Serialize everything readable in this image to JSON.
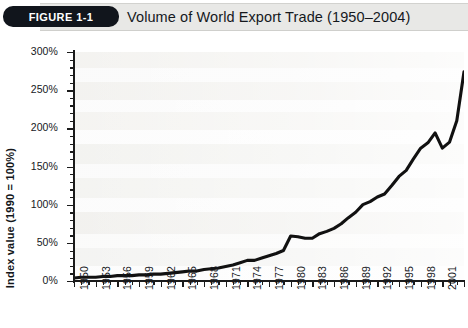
{
  "header": {
    "figure_badge": "FIGURE 1-1",
    "title": "Volume of World Export Trade (1950–2004)"
  },
  "footer": {
    "source_cropped": ""
  },
  "axes": {
    "y_title": "Index value (1990 = 100%)",
    "y_ticks": [
      "0%",
      "50%",
      "100%",
      "150%",
      "200%",
      "250%",
      "300%"
    ],
    "x_ticks": [
      "1950",
      "1953",
      "1956",
      "1959",
      "1962",
      "1965",
      "1968",
      "1971",
      "1974",
      "1977",
      "1980",
      "1983",
      "1986",
      "1989",
      "1992",
      "1995",
      "1998",
      "2001",
      "2004"
    ]
  },
  "colors": {
    "line": "#111111",
    "badge_bg": "#11151c",
    "badge_text": "#ffffff",
    "title_band": "#e8e8e6",
    "axis": "#1b1b1b",
    "plot_bg": "#ffffff"
  },
  "chart_data": {
    "type": "line",
    "title": "Volume of World Export Trade (1950–2004)",
    "xlabel": "",
    "ylabel": "Index value (1990 = 100%)",
    "xlim": [
      1950,
      2004
    ],
    "ylim": [
      0,
      300
    ],
    "y_tick_step": 50,
    "y_minor_tick_step": 10,
    "x_tick_step": 3,
    "x_minor_tick_step": 1,
    "grid": false,
    "legend": "none",
    "unit": "percent",
    "series": [
      {
        "name": "World export trade volume index",
        "x": [
          1950,
          1951,
          1952,
          1953,
          1954,
          1955,
          1956,
          1957,
          1958,
          1959,
          1960,
          1961,
          1962,
          1963,
          1964,
          1965,
          1966,
          1967,
          1968,
          1969,
          1970,
          1971,
          1972,
          1973,
          1974,
          1975,
          1976,
          1977,
          1978,
          1979,
          1980,
          1981,
          1982,
          1983,
          1984,
          1985,
          1986,
          1987,
          1988,
          1989,
          1990,
          1991,
          1992,
          1993,
          1994,
          1995,
          1996,
          1997,
          1998,
          1999,
          2000,
          2001,
          2002,
          2003,
          2004
        ],
        "values": [
          4,
          5,
          5,
          5,
          6,
          6,
          7,
          7,
          7,
          8,
          8,
          9,
          9,
          10,
          11,
          12,
          13,
          13,
          15,
          16,
          17,
          19,
          21,
          24,
          27,
          27,
          30,
          33,
          36,
          40,
          59,
          58,
          56,
          56,
          62,
          65,
          69,
          75,
          83,
          90,
          100,
          104,
          110,
          114,
          125,
          137,
          145,
          160,
          174,
          181,
          194,
          174,
          182,
          210,
          274
        ]
      }
    ]
  }
}
